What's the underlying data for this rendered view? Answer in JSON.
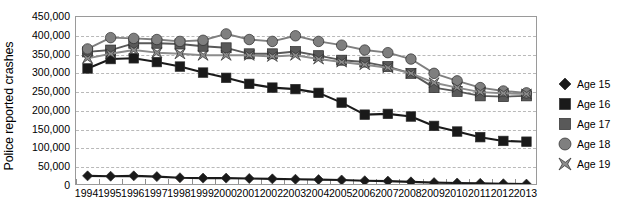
{
  "chart_data": {
    "type": "line",
    "title": "",
    "xlabel": "",
    "ylabel": "Police reported crashes",
    "x": [
      1994,
      1995,
      1996,
      1997,
      1998,
      1999,
      2000,
      2001,
      2002,
      2003,
      2004,
      2005,
      2006,
      2007,
      2008,
      2009,
      2010,
      2011,
      2012,
      2013
    ],
    "categories": [
      "1994",
      "1995",
      "1996",
      "1997",
      "1998",
      "1999",
      "2000",
      "2001",
      "2002",
      "2003",
      "2004",
      "2005",
      "2006",
      "2007",
      "2008",
      "2009",
      "2010",
      "2011",
      "2012",
      "2013"
    ],
    "ylim": [
      0,
      450000
    ],
    "ytick_values": [
      0,
      50000,
      100000,
      150000,
      200000,
      250000,
      300000,
      350000,
      400000,
      450000
    ],
    "ytick_labels": [
      "0",
      "50,000",
      "100,000",
      "150,000",
      "200,000",
      "250,000",
      "300,000",
      "350,000",
      "400,000",
      "450,000"
    ],
    "grid": true,
    "legend_position": "right",
    "series": [
      {
        "name": "Age 15",
        "marker": "diamond",
        "color": "#1a1a1a",
        "values": [
          27000,
          26000,
          27000,
          25000,
          22000,
          21000,
          21000,
          20000,
          19000,
          18000,
          17000,
          16000,
          14000,
          13000,
          11000,
          9000,
          8000,
          7000,
          6000,
          5000
        ]
      },
      {
        "name": "Age 16",
        "marker": "square",
        "color": "#1a1a1a",
        "values": [
          313000,
          338000,
          340000,
          330000,
          318000,
          302000,
          288000,
          272000,
          262000,
          258000,
          248000,
          222000,
          190000,
          192000,
          185000,
          160000,
          145000,
          130000,
          120000,
          118000
        ]
      },
      {
        "name": "Age 17",
        "marker": "square",
        "color": "#595959",
        "values": [
          357000,
          362000,
          380000,
          380000,
          378000,
          372000,
          368000,
          352000,
          352000,
          358000,
          347000,
          335000,
          330000,
          318000,
          300000,
          262000,
          252000,
          240000,
          238000,
          240000
        ]
      },
      {
        "name": "Age 18",
        "marker": "circle",
        "color": "#7f7f7f",
        "values": [
          365000,
          395000,
          393000,
          390000,
          385000,
          388000,
          405000,
          390000,
          385000,
          400000,
          385000,
          375000,
          362000,
          355000,
          338000,
          300000,
          280000,
          262000,
          253000,
          248000
        ]
      },
      {
        "name": "Age 19",
        "marker": "x",
        "color": "#8c8c8c",
        "values": [
          340000,
          352000,
          362000,
          355000,
          352000,
          348000,
          348000,
          348000,
          345000,
          348000,
          338000,
          330000,
          323000,
          315000,
          300000,
          275000,
          262000,
          250000,
          247000,
          245000
        ]
      }
    ]
  },
  "legend": {
    "items": [
      {
        "label": "Age 15"
      },
      {
        "label": "Age 16"
      },
      {
        "label": "Age 17"
      },
      {
        "label": "Age 18"
      },
      {
        "label": "Age 19"
      }
    ]
  }
}
